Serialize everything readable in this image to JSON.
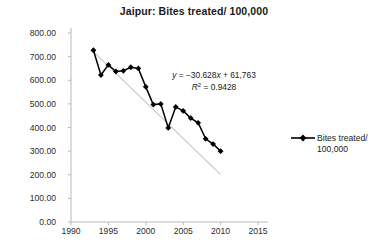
{
  "chart_data": {
    "type": "line",
    "title": "Jaipur: Bites treated/ 100,000",
    "xlabel": "",
    "ylabel": "",
    "xlim": [
      1990,
      2015
    ],
    "ylim": [
      0,
      800
    ],
    "grid": false,
    "legend_position": "right",
    "x_ticks": [
      "1990",
      "1995",
      "2000",
      "2005",
      "2010",
      "2015"
    ],
    "x_tick_values": [
      1990,
      1995,
      2000,
      2005,
      2010,
      2015
    ],
    "y_ticks": [
      "0.00",
      "100.00",
      "200.00",
      "300.00",
      "400.00",
      "500.00",
      "600.00",
      "700.00",
      "800.00"
    ],
    "y_tick_values": [
      0,
      100,
      200,
      300,
      400,
      500,
      600,
      700,
      800
    ],
    "series": [
      {
        "name": "Bites treated/ 100,000",
        "marker": "diamond",
        "color": "#000000",
        "x": [
          1993,
          1994,
          1995,
          1996,
          1997,
          1998,
          1999,
          2000,
          2001,
          2002,
          2003,
          2004,
          2005,
          2006,
          2007,
          2008,
          2009,
          2010
        ],
        "values": [
          727,
          622,
          665,
          637,
          640,
          655,
          650,
          572,
          497,
          500,
          398,
          487,
          470,
          440,
          420,
          352,
          330,
          300
        ]
      }
    ],
    "trendline": {
      "equation": "y = −30.628x + 61,763",
      "equation_y_part": "y",
      "equation_rest": " = −30.628",
      "equation_x_part": "x",
      "equation_tail": " + 61,763",
      "r_squared_label": "R",
      "r_squared_exp": "2",
      "r_squared_value": " = 0.9428",
      "slope": -30.628,
      "intercept": 61763,
      "r2": 0.9428,
      "color": "#c9c9c9"
    },
    "legend": [
      {
        "label_line1": "Bites treated/",
        "label_line2": "100,000",
        "color": "#000000",
        "marker": "diamond"
      }
    ]
  }
}
